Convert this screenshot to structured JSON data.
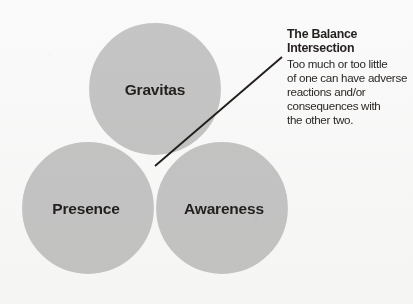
{
  "diagram": {
    "type": "venn-3-circle",
    "background_color": "#f8f8f7",
    "circle_fill_color": "#c9c9c9",
    "circle_stroke_color": "#ffffff",
    "overlap_color": "#a8a8a8",
    "text_color": "#231f1e",
    "circles": [
      {
        "id": "gravitas",
        "label": "Gravitas",
        "cx": 155,
        "cy": 89,
        "r": 67,
        "label_x": 155,
        "label_y": 95
      },
      {
        "id": "presence",
        "label": "Presence",
        "cx": 88,
        "cy": 208,
        "r": 67,
        "label_x": 86,
        "label_y": 214
      },
      {
        "id": "awareness",
        "label": "Awareness",
        "cx": 222,
        "cy": 208,
        "r": 67,
        "label_x": 224,
        "label_y": 214
      }
    ],
    "leader_line": {
      "x1": 282,
      "y1": 57,
      "x2": 155,
      "y2": 166
    }
  },
  "callout": {
    "title": "The Balance\nIntersection",
    "body_lines": [
      "Too much or too little",
      "of one can have adverse",
      "reactions and/or",
      "consequences with",
      "the other two."
    ]
  }
}
